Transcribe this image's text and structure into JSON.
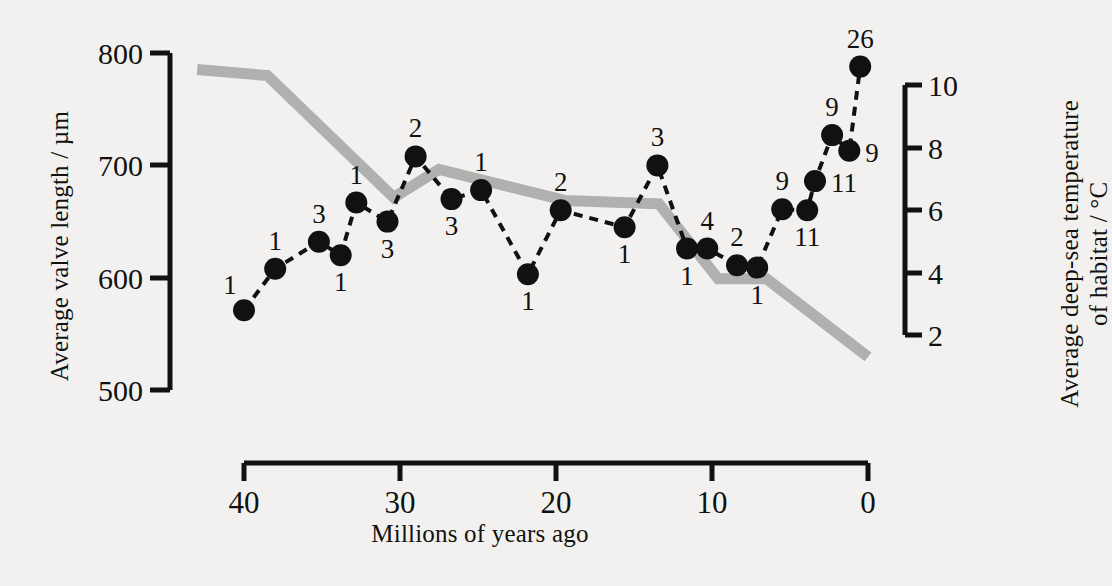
{
  "chart_data": {
    "type": "line",
    "title": "",
    "xlabel": "Millions of years ago",
    "ylabel_left": "Average valve length / µm",
    "ylabel_right": "Average deep-sea temperature of habitat / °C",
    "ylabel_right_line1": "Average deep-sea temperature",
    "ylabel_right_line2": "of habitat / °C",
    "x_axis": {
      "label": "Millions of years ago",
      "ticks": [
        40,
        30,
        20,
        10,
        0
      ],
      "tick_labels": [
        "40",
        "30",
        "20",
        "10",
        "0"
      ],
      "range": [
        43,
        0
      ],
      "reversed": true,
      "grid": false
    },
    "y_axis_left": {
      "label": "Average valve length / µm",
      "ticks": [
        500,
        600,
        700,
        800
      ],
      "tick_labels": [
        "500",
        "600",
        "700",
        "800"
      ],
      "range": [
        500,
        800
      ],
      "grid": false
    },
    "y_axis_right": {
      "label": "Average deep-sea temperature of habitat / °C",
      "ticks": [
        2,
        4,
        6,
        8,
        10
      ],
      "tick_labels": [
        "2",
        "4",
        "6",
        "8",
        "10"
      ],
      "range": [
        2,
        10
      ],
      "grid": false
    },
    "legend": {
      "entries": [],
      "position": "none"
    },
    "series": [
      {
        "name": "Average valve length",
        "axis": "left",
        "style": "dashed-line-with-filled-circles",
        "color": "#111111",
        "point_labels_are": "sample size (n)",
        "points": [
          {
            "x": 40.0,
            "y": 571,
            "label": "1",
            "label_pos": "above-left"
          },
          {
            "x": 38.0,
            "y": 608,
            "label": "1",
            "label_pos": "above"
          },
          {
            "x": 35.2,
            "y": 632,
            "label": "3",
            "label_pos": "above"
          },
          {
            "x": 33.8,
            "y": 620,
            "label": "1",
            "label_pos": "below"
          },
          {
            "x": 32.8,
            "y": 667,
            "label": "1",
            "label_pos": "above"
          },
          {
            "x": 30.8,
            "y": 650,
            "label": "3",
            "label_pos": "below"
          },
          {
            "x": 29.0,
            "y": 708,
            "label": "2",
            "label_pos": "above"
          },
          {
            "x": 26.7,
            "y": 670,
            "label": "3",
            "label_pos": "below"
          },
          {
            "x": 24.8,
            "y": 678,
            "label": "1",
            "label_pos": "above"
          },
          {
            "x": 21.8,
            "y": 603,
            "label": "1",
            "label_pos": "below"
          },
          {
            "x": 19.7,
            "y": 660,
            "label": "2",
            "label_pos": "above"
          },
          {
            "x": 15.6,
            "y": 645,
            "label": "1",
            "label_pos": "below"
          },
          {
            "x": 13.5,
            "y": 700,
            "label": "3",
            "label_pos": "above"
          },
          {
            "x": 11.6,
            "y": 626,
            "label": "1",
            "label_pos": "below"
          },
          {
            "x": 10.3,
            "y": 626,
            "label": "4",
            "label_pos": "above"
          },
          {
            "x": 8.4,
            "y": 611,
            "label": "2",
            "label_pos": "above"
          },
          {
            "x": 7.1,
            "y": 609,
            "label": "1",
            "label_pos": "below"
          },
          {
            "x": 5.5,
            "y": 661,
            "label": "9",
            "label_pos": "above"
          },
          {
            "x": 3.9,
            "y": 660,
            "label": "11",
            "label_pos": "below"
          },
          {
            "x": 3.4,
            "y": 686,
            "label": "11",
            "label_pos": "right"
          },
          {
            "x": 2.3,
            "y": 727,
            "label": "9",
            "label_pos": "above"
          },
          {
            "x": 1.2,
            "y": 713,
            "label": "9",
            "label_pos": "right"
          },
          {
            "x": 0.5,
            "y": 788,
            "label": "26",
            "label_pos": "above"
          }
        ]
      },
      {
        "name": "Average deep-sea temperature",
        "axis": "right",
        "style": "thick-grey-line",
        "color": "#b0b0b0",
        "points": [
          {
            "x": 43.0,
            "temp": 10.5
          },
          {
            "x": 38.5,
            "temp": 10.3
          },
          {
            "x": 30.4,
            "temp": 6.4
          },
          {
            "x": 27.5,
            "temp": 7.3
          },
          {
            "x": 19.4,
            "temp": 6.3
          },
          {
            "x": 13.4,
            "temp": 6.2
          },
          {
            "x": 9.6,
            "temp": 3.8
          },
          {
            "x": 6.5,
            "temp": 3.8
          },
          {
            "x": 0.0,
            "temp": 1.3
          }
        ]
      }
    ]
  },
  "axis_ticks": {
    "x": [
      "40",
      "30",
      "20",
      "10",
      "0"
    ],
    "y_left": [
      "800",
      "700",
      "600",
      "500"
    ],
    "y_right": [
      "10",
      "8",
      "6",
      "4",
      "2"
    ]
  },
  "labels": {
    "x_title": "Millions of years ago",
    "y_left_title": "Average valve length / µm",
    "y_right_title_line1": "Average deep-sea temperature",
    "y_right_title_line2": "of habitat / °C"
  },
  "colors": {
    "background": "#f2f1ef",
    "axis": "#111111",
    "points": "#111111",
    "temperature_line": "#b0b0b0"
  }
}
